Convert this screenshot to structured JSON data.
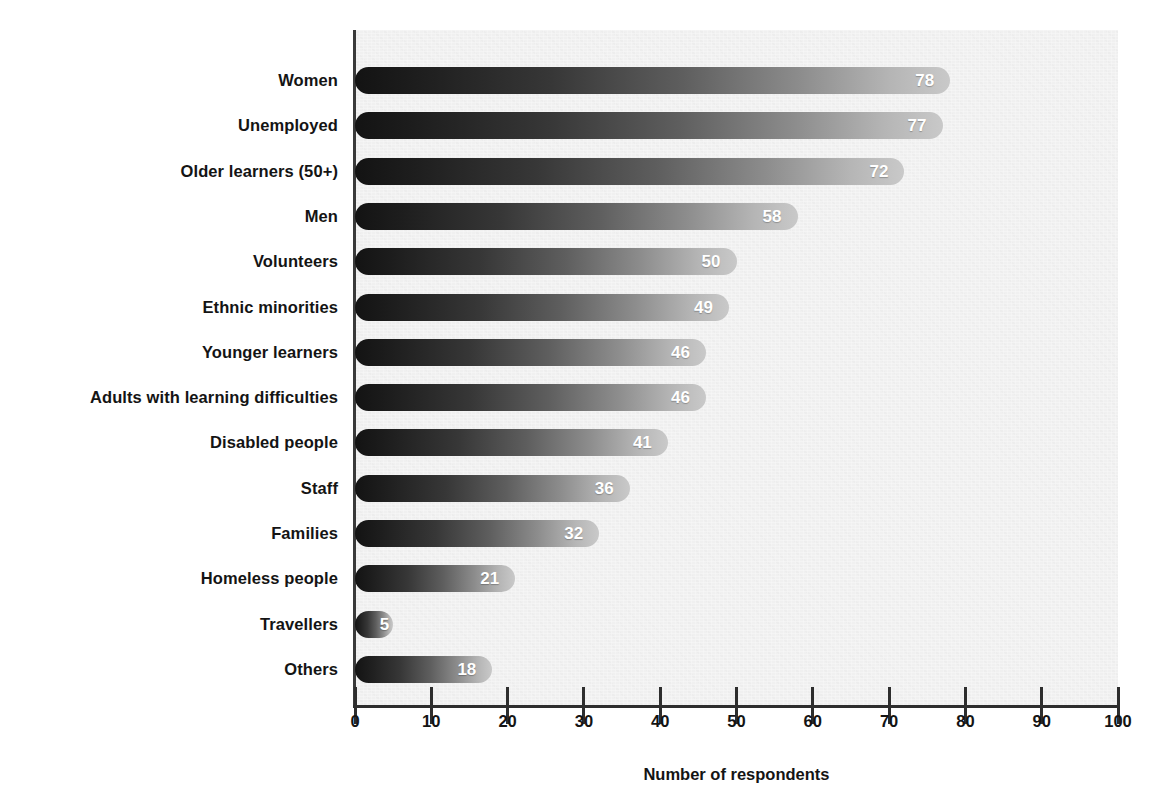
{
  "chart_data": {
    "type": "bar",
    "orientation": "horizontal",
    "title": "",
    "xlabel": "Number of respondents",
    "ylabel": "",
    "xlim": [
      0,
      100
    ],
    "xticks": [
      "0",
      "10",
      "20",
      "30",
      "40",
      "50",
      "60",
      "70",
      "80",
      "90",
      "100"
    ],
    "grid": false,
    "legend": null,
    "categories": [
      "Women",
      "Unemployed",
      "Older learners (50+)",
      "Men",
      "Volunteers",
      "Ethnic minorities",
      "Younger learners",
      "Adults with learning difficulties",
      "Disabled people",
      "Staff",
      "Families",
      "Homeless people",
      "Travellers",
      "Others"
    ],
    "values": [
      78,
      77,
      72,
      58,
      50,
      49,
      46,
      46,
      41,
      36,
      32,
      21,
      5,
      18
    ],
    "value_labels": [
      "78",
      "77",
      "72",
      "58",
      "50",
      "49",
      "46",
      "46",
      "41",
      "36",
      "32",
      "21",
      "5",
      "18"
    ]
  },
  "style": {
    "plot_background": "#f0f0f0",
    "page_background": "#ffffff",
    "axis_color": "#2e2e2e",
    "bar_gradient_start": "#131313",
    "bar_gradient_end": "#c9c9c9",
    "value_label_color": "#ffffff",
    "text_color": "#141414"
  }
}
